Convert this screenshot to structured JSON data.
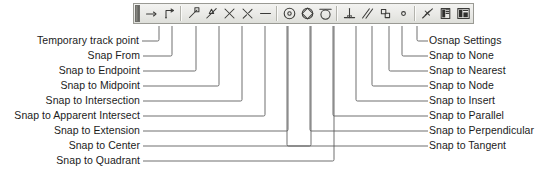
{
  "diagram": {
    "line_color": "#555555",
    "text_color": "#1b1b1b",
    "toolbar_bg": "#ecece9",
    "toolbar_border": "#9a9a94"
  },
  "toolbar": {
    "name": "Object Snap",
    "grip_label": "toolbar-drag-grip",
    "buttons": [
      {
        "id": "temporary-track-point",
        "label": "Temporary track point",
        "icon": "temporary-track-point-icon"
      },
      {
        "id": "snap-from",
        "label": "Snap From",
        "icon": "snap-from-icon"
      },
      {
        "id": "snap-to-endpoint",
        "label": "Snap to Endpoint",
        "icon": "snap-to-endpoint-icon"
      },
      {
        "id": "snap-to-midpoint",
        "label": "Snap to Midpoint",
        "icon": "snap-to-midpoint-icon"
      },
      {
        "id": "snap-to-intersection",
        "label": "Snap to Intersection",
        "icon": "snap-to-intersection-icon"
      },
      {
        "id": "snap-to-apparent-intersect",
        "label": "Snap to Apparent Intersect",
        "icon": "snap-to-apparent-intersect-icon"
      },
      {
        "id": "snap-to-extension",
        "label": "Snap to Extension",
        "icon": "snap-to-extension-icon"
      },
      {
        "id": "snap-to-center",
        "label": "Snap to Center",
        "icon": "snap-to-center-icon"
      },
      {
        "id": "snap-to-quadrant",
        "label": "Snap to Quadrant",
        "icon": "snap-to-quadrant-icon"
      },
      {
        "id": "snap-to-tangent",
        "label": "Snap to Tangent",
        "icon": "snap-to-tangent-icon"
      },
      {
        "id": "snap-to-perpendicular",
        "label": "Snap to Perpendicular",
        "icon": "snap-to-perpendicular-icon"
      },
      {
        "id": "snap-to-parallel",
        "label": "Snap to Parallel",
        "icon": "snap-to-parallel-icon"
      },
      {
        "id": "snap-to-insert",
        "label": "Snap to Insert",
        "icon": "snap-to-insert-icon"
      },
      {
        "id": "snap-to-node",
        "label": "Snap to Node",
        "icon": "snap-to-node-icon"
      },
      {
        "id": "snap-to-nearest",
        "label": "Snap to Nearest",
        "icon": "snap-to-nearest-icon"
      },
      {
        "id": "snap-to-none",
        "label": "Snap to None",
        "icon": "snap-to-none-icon"
      },
      {
        "id": "osnap-settings",
        "label": "Osnap Settings",
        "icon": "osnap-settings-icon"
      }
    ]
  },
  "callouts": {
    "left": [
      {
        "ref": "temporary-track-point",
        "label": "Temporary track point"
      },
      {
        "ref": "snap-from",
        "label": "Snap From"
      },
      {
        "ref": "snap-to-endpoint",
        "label": "Snap to Endpoint"
      },
      {
        "ref": "snap-to-midpoint",
        "label": "Snap to Midpoint"
      },
      {
        "ref": "snap-to-intersection",
        "label": "Snap to Intersection"
      },
      {
        "ref": "snap-to-apparent-intersect",
        "label": "Snap to Apparent Intersect"
      },
      {
        "ref": "snap-to-extension",
        "label": "Snap to Extension"
      },
      {
        "ref": "snap-to-center",
        "label": "Snap to Center"
      },
      {
        "ref": "snap-to-quadrant",
        "label": "Snap to Quadrant"
      }
    ],
    "right": [
      {
        "ref": "osnap-settings",
        "label": "Osnap Settings"
      },
      {
        "ref": "snap-to-none",
        "label": "Snap to None"
      },
      {
        "ref": "snap-to-nearest",
        "label": "Snap to Nearest"
      },
      {
        "ref": "snap-to-node",
        "label": "Snap to Node"
      },
      {
        "ref": "snap-to-insert",
        "label": "Snap to Insert"
      },
      {
        "ref": "snap-to-parallel",
        "label": "Snap to Parallel"
      },
      {
        "ref": "snap-to-perpendicular",
        "label": "Snap to Perpendicular"
      },
      {
        "ref": "snap-to-tangent",
        "label": "Snap to Tangent"
      }
    ]
  }
}
